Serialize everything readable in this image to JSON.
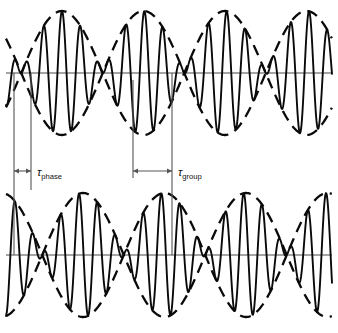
{
  "figure": {
    "background_color": "#ffffff",
    "ink_color": "#0a0a0a",
    "axis_color": "#4a4a4a",
    "marker_color": "#555555",
    "width": 338,
    "height": 333
  },
  "labels": {
    "tau_symbol": "τ",
    "phase_subscript": "phase",
    "group_subscript": "group",
    "tau_phase_full": "τphase",
    "tau_group_full": "τgroup"
  },
  "annotations": {
    "tau_phase": {
      "name": "tau-phase",
      "symbol": "τ",
      "subscript": "phase",
      "arrow_x_start": 14,
      "arrow_x_end": 31,
      "arrow_y": 171,
      "label_x": 37,
      "label_y": 176,
      "span_px": 17
    },
    "tau_group": {
      "name": "tau-group",
      "symbol": "τ",
      "subscript": "group",
      "arrow_x_start": 133,
      "arrow_x_end": 172,
      "arrow_y": 171,
      "label_x": 178,
      "label_y": 176,
      "span_px": 39
    }
  },
  "marker_lines": [
    {
      "name": "marker-left-carrier-peak",
      "x": 14,
      "y_top": 73,
      "y_bottom": 255
    },
    {
      "name": "marker-phase-end",
      "x": 31,
      "y_top": 73,
      "y_bottom": 190
    },
    {
      "name": "marker-envelope-null-top",
      "x": 133,
      "y_top": 80,
      "y_bottom": 178
    },
    {
      "name": "marker-group-end",
      "x": 172,
      "y_top": 73,
      "y_bottom": 255
    }
  ],
  "chart_data": {
    "type": "line",
    "xlabel": "",
    "ylabel": "",
    "grid": false,
    "legend": "none",
    "xlim": [
      0,
      338
    ],
    "panels": [
      {
        "name": "upper-waveform",
        "axis_y": 73,
        "x_start": 6,
        "x_end": 332,
        "amplitude": 62,
        "carrier_period_px": 18.3,
        "carrier_phase_deg": 90,
        "envelope_period_px": 163,
        "envelope_phase_deg": 90,
        "envelope_offset_px": 62,
        "description": "Amplitude-modulated carrier with dashed envelope; carrier crest aligned at x=14"
      },
      {
        "name": "lower-waveform",
        "axis_y": 255,
        "x_start": 6,
        "x_end": 332,
        "amplitude": 62,
        "carrier_period_px": 18.3,
        "carrier_phase_deg": 90,
        "carrier_shift_px": 17,
        "envelope_period_px": 163,
        "envelope_phase_deg": 90,
        "envelope_shift_px": 39,
        "envelope_offset_px": 83,
        "description": "Same carrier delayed by tau_phase and envelope delayed by tau_group"
      }
    ],
    "series": [
      {
        "name": "upper-carrier",
        "style": "solid",
        "panel": "upper-waveform"
      },
      {
        "name": "upper-envelope-upper",
        "style": "dashed",
        "panel": "upper-waveform"
      },
      {
        "name": "upper-envelope-lower",
        "style": "dashed",
        "panel": "upper-waveform"
      },
      {
        "name": "lower-carrier",
        "style": "solid",
        "panel": "lower-waveform"
      },
      {
        "name": "lower-envelope-upper",
        "style": "dashed",
        "panel": "lower-waveform"
      },
      {
        "name": "lower-envelope-lower",
        "style": "dashed",
        "panel": "lower-waveform"
      }
    ]
  }
}
